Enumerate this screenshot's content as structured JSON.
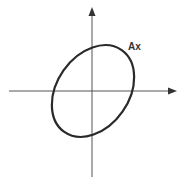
{
  "diagram": {
    "type": "ellipse-transform",
    "curve_label": "Ax",
    "colors": {
      "background": "#ffffff",
      "axis": "#444444",
      "curve": "#2a2a2a",
      "label": "#333333"
    },
    "axes": {
      "origin": [
        92,
        91
      ],
      "x_axis": {
        "from": [
          9,
          91
        ],
        "to": [
          176,
          91
        ],
        "arrow": "right"
      },
      "y_axis": {
        "from": [
          92,
          177
        ],
        "to": [
          92,
          8
        ],
        "arrow": "up"
      }
    },
    "ellipse": {
      "center": [
        93,
        91
      ],
      "rx": 50,
      "ry": 36,
      "rotation_deg": -55
    }
  }
}
